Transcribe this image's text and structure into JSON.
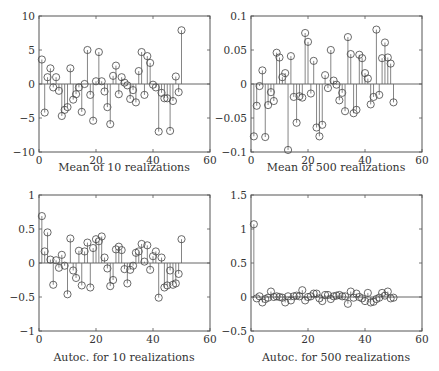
{
  "chart_data": [
    {
      "type": "stem",
      "title": "",
      "xlabel": "Mean of 10 realizations",
      "ylabel": "",
      "xlim": [
        0,
        60
      ],
      "ylim": [
        -10,
        10
      ],
      "xticks": [
        0,
        20,
        40,
        60
      ],
      "yticks": [
        10,
        5,
        0,
        -5,
        -10
      ],
      "ytick_labels": [
        "10",
        "5",
        "0",
        "−5",
        "−10"
      ],
      "grid": false,
      "x": [
        1,
        2,
        3,
        4,
        5,
        6,
        7,
        8,
        9,
        10,
        11,
        12,
        13,
        14,
        15,
        16,
        17,
        18,
        19,
        20,
        21,
        22,
        23,
        24,
        25,
        26,
        27,
        28,
        29,
        30,
        31,
        32,
        33,
        34,
        35,
        36,
        37,
        38,
        39,
        40,
        41,
        42,
        43,
        44,
        45,
        46,
        47,
        48,
        49,
        50
      ],
      "values": [
        3.6,
        -4.2,
        1.0,
        2.3,
        -0.5,
        1.0,
        -1.0,
        -4.7,
        -3.8,
        -3.4,
        2.3,
        -2.3,
        -1.5,
        -0.5,
        -4.1,
        0.0,
        5.0,
        -1.6,
        -5.4,
        0.4,
        4.7,
        0.4,
        -1.1,
        -3.4,
        -5.9,
        1.2,
        2.7,
        -1.5,
        1.0,
        0.2,
        -0.2,
        -2.2,
        -0.9,
        -2.7,
        1.9,
        4.7,
        -1.6,
        4.1,
        3.1,
        -0.1,
        -0.5,
        -7.0,
        -1.3,
        -2.1,
        -2.1,
        -6.9,
        -2.5,
        1.1,
        -1.2,
        7.9
      ]
    },
    {
      "type": "stem",
      "title": "",
      "xlabel": "Mean of 500 realizations",
      "ylabel": "",
      "xlim": [
        0,
        60
      ],
      "ylim": [
        -0.1,
        0.1
      ],
      "xticks": [
        0,
        20,
        40,
        60
      ],
      "yticks": [
        0.1,
        0.05,
        0,
        -0.05,
        -0.1
      ],
      "ytick_labels": [
        "0.1",
        "0.05",
        "0",
        "−0.05",
        "−0.1"
      ],
      "grid": false,
      "x": [
        1,
        2,
        3,
        4,
        5,
        6,
        7,
        8,
        9,
        10,
        11,
        12,
        13,
        14,
        15,
        16,
        17,
        18,
        19,
        20,
        21,
        22,
        23,
        24,
        25,
        26,
        27,
        28,
        29,
        30,
        31,
        32,
        33,
        34,
        35,
        36,
        37,
        38,
        39,
        40,
        41,
        42,
        43,
        44,
        45,
        46,
        47,
        48,
        49,
        50
      ],
      "values": [
        -0.077,
        -0.032,
        -0.003,
        0.02,
        -0.078,
        -0.031,
        -0.012,
        -0.025,
        0.046,
        0.039,
        0.01,
        0.016,
        -0.097,
        0.041,
        -0.019,
        -0.057,
        -0.018,
        -0.02,
        0.075,
        0.062,
        -0.014,
        0.034,
        -0.064,
        -0.077,
        -0.06,
        0.013,
        -0.006,
        0.05,
        0.005,
        -0.001,
        -0.024,
        -0.013,
        -0.04,
        0.069,
        0.044,
        -0.043,
        -0.038,
        0.043,
        0.038,
        0.016,
        0.008,
        -0.03,
        -0.019,
        0.08,
        -0.016,
        0.038,
        0.061,
        0.039,
        0.03,
        -0.027
      ]
    },
    {
      "type": "stem",
      "title": "",
      "xlabel": "Autoc. for 10 realizations",
      "ylabel": "",
      "xlim": [
        0,
        60
      ],
      "ylim": [
        -1,
        1
      ],
      "xticks": [
        0,
        20,
        40,
        60
      ],
      "yticks": [
        1,
        0.5,
        0,
        -0.5,
        -1
      ],
      "ytick_labels": [
        "1",
        "0.5",
        "0",
        "−0.5",
        "−1"
      ],
      "grid": false,
      "x": [
        1,
        2,
        3,
        4,
        5,
        6,
        7,
        8,
        9,
        10,
        11,
        12,
        13,
        14,
        15,
        16,
        17,
        18,
        19,
        20,
        21,
        22,
        23,
        24,
        25,
        26,
        27,
        28,
        29,
        30,
        31,
        32,
        33,
        34,
        35,
        36,
        37,
        38,
        39,
        40,
        41,
        42,
        43,
        44,
        45,
        46,
        47,
        48,
        49,
        50
      ],
      "values": [
        0.69,
        0.17,
        0.45,
        0.05,
        -0.32,
        0.04,
        -0.07,
        0.12,
        -0.04,
        -0.46,
        0.36,
        -0.11,
        -0.22,
        0.18,
        -0.33,
        0.17,
        0.3,
        -0.36,
        0.22,
        0.35,
        0.32,
        0.39,
        0.08,
        -0.08,
        -0.34,
        -0.25,
        0.2,
        0.24,
        0.19,
        -0.09,
        -0.3,
        -0.1,
        -0.04,
        0.15,
        0.17,
        0.28,
        0.02,
        0.26,
        -0.1,
        0.1,
        0.17,
        -0.51,
        0.08,
        -0.36,
        -0.33,
        -0.11,
        -0.32,
        -0.3,
        -0.16,
        0.35
      ]
    },
    {
      "type": "stem",
      "title": "",
      "xlabel": "Autoc. for 500 realizations",
      "ylabel": "",
      "xlim": [
        0,
        60
      ],
      "ylim": [
        -0.5,
        1.5
      ],
      "xticks": [
        0,
        20,
        40,
        60
      ],
      "yticks": [
        1.5,
        1,
        0.5,
        0,
        -0.5
      ],
      "ytick_labels": [
        "1.5",
        "1",
        "0.5",
        "0",
        "−0.5"
      ],
      "grid": false,
      "x": [
        1,
        2,
        3,
        4,
        5,
        6,
        7,
        8,
        9,
        10,
        11,
        12,
        13,
        14,
        15,
        16,
        17,
        18,
        19,
        20,
        21,
        22,
        23,
        24,
        25,
        26,
        27,
        28,
        29,
        30,
        31,
        32,
        33,
        34,
        35,
        36,
        37,
        38,
        39,
        40,
        41,
        42,
        43,
        44,
        45,
        46,
        47,
        48,
        49,
        50
      ],
      "values": [
        1.07,
        -0.02,
        0.01,
        -0.08,
        -0.03,
        -0.01,
        0.08,
        0.0,
        0.01,
        0.0,
        -0.01,
        -0.08,
        0.01,
        -0.05,
        0.01,
        0.02,
        0.01,
        0.1,
        -0.05,
        0.0,
        0.01,
        0.05,
        0.05,
        -0.02,
        -0.06,
        0.03,
        0.03,
        -0.03,
        0.01,
        0.02,
        0.03,
        0.01,
        0.01,
        -0.1,
        0.08,
        -0.01,
        0.05,
        0.0,
        -0.02,
        -0.06,
        0.06,
        -0.08,
        -0.07,
        -0.03,
        -0.01,
        0.06,
        0.02,
        0.08,
        -0.02,
        -0.01
      ]
    }
  ],
  "panels": [
    {
      "xlabel": "Mean of 10 realizations"
    },
    {
      "xlabel": "Mean of 500 realizations"
    },
    {
      "xlabel": "Autoc. for 10 realizations"
    },
    {
      "xlabel": "Autoc. for 500 realizations"
    }
  ],
  "style": {
    "axis_color": "#555555",
    "stem_color": "#666666",
    "marker_color": "#444444",
    "background": "#ffffff"
  }
}
